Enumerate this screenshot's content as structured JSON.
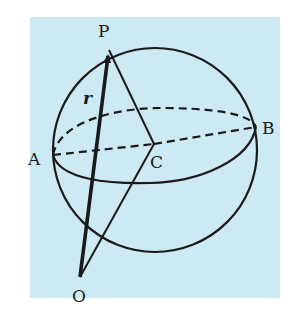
{
  "figure": {
    "background_color": "#cdeaf4",
    "stroke_color": "#1a1a1a",
    "labels": {
      "P": "P",
      "A": "A",
      "B": "B",
      "C": "C",
      "O": "O",
      "r": "r"
    },
    "points": {
      "P": [
        109,
        50
      ],
      "A": [
        53,
        155
      ],
      "B": [
        256,
        127
      ],
      "C": [
        154,
        144
      ],
      "O": [
        80,
        277
      ]
    },
    "elements": [
      "sphere outline",
      "equatorial ellipse through A and B (front half solid, back half dashed)",
      "dashed segment A-C",
      "dashed segment C-B",
      "solid segment P-C",
      "solid segment O-C",
      "bold vector O->P labelled r with arrowhead at P"
    ]
  }
}
